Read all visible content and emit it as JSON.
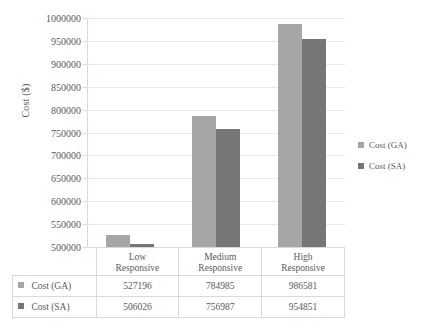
{
  "chart_data": {
    "type": "bar",
    "title": "",
    "xlabel": "",
    "ylabel": "Cost ($)",
    "ylim": [
      500000,
      1000000
    ],
    "ytick_step": 50000,
    "grid": true,
    "legend_position": "right",
    "categories": [
      "Low Responsive",
      "Medium Responsive",
      "High Responsive"
    ],
    "series": [
      {
        "name": "Cost (GA)",
        "color": "#a6a6a6",
        "values": [
          527196,
          784985,
          986581
        ]
      },
      {
        "name": "Cost (SA)",
        "color": "#767676",
        "values": [
          506026,
          756987,
          954851
        ]
      }
    ],
    "ytick_labels": [
      "500000",
      "550000",
      "600000",
      "650000",
      "700000",
      "750000",
      "800000",
      "850000",
      "900000",
      "950000",
      "1000000"
    ]
  },
  "axis": {
    "y_title": "Cost ($)",
    "ticks": [
      {
        "label": "1000000",
        "value": 1000000
      },
      {
        "label": "950000",
        "value": 950000
      },
      {
        "label": "900000",
        "value": 900000
      },
      {
        "label": "850000",
        "value": 850000
      },
      {
        "label": "800000",
        "value": 800000
      },
      {
        "label": "750000",
        "value": 750000
      },
      {
        "label": "700000",
        "value": 700000
      },
      {
        "label": "650000",
        "value": 650000
      },
      {
        "label": "600000",
        "value": 600000
      },
      {
        "label": "550000",
        "value": 550000
      },
      {
        "label": "500000",
        "value": 500000
      }
    ]
  },
  "legend": {
    "items": [
      {
        "label": "Cost (GA)",
        "color": "#a6a6a6"
      },
      {
        "label": "Cost (SA)",
        "color": "#767676"
      }
    ]
  },
  "table": {
    "columns": [
      {
        "line1": "Low",
        "line2": "Responsive"
      },
      {
        "line1": "Medium",
        "line2": "Responsive"
      },
      {
        "line1": "High",
        "line2": "Responsive"
      }
    ],
    "rows": [
      {
        "label": "Cost (GA)",
        "color": "#a6a6a6",
        "cells": [
          "527196",
          "784985",
          "986581"
        ]
      },
      {
        "label": "Cost (SA)",
        "color": "#767676",
        "cells": [
          "506026",
          "756987",
          "954851"
        ]
      }
    ]
  }
}
